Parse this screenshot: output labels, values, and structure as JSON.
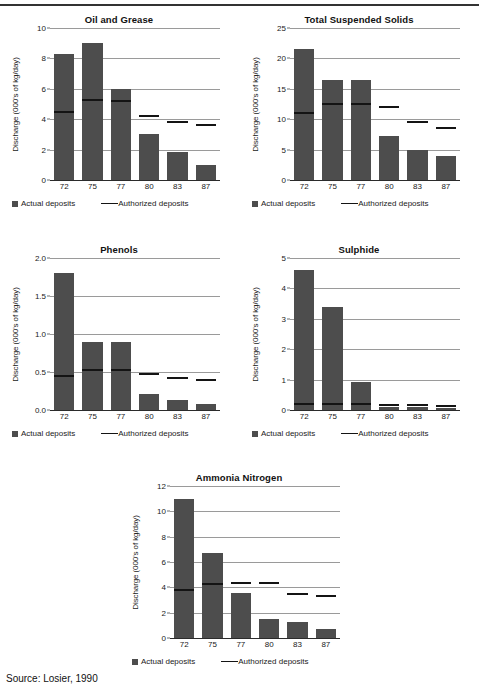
{
  "figure": {
    "source_note": "Source: Losier, 1990",
    "legend": {
      "actual_label": "Actual deposits",
      "authorized_label": "Authorized deposits"
    },
    "axis_label_y": "Discharge (000's of kg/day)",
    "bar_color": "#4d4d4d",
    "line_color": "#141414",
    "gridline_color": "#9a9a9a"
  },
  "chart_data": [
    {
      "type": "bar",
      "title": "Oil and Grease",
      "xlabel": "",
      "ylabel": "Discharge (000's of kg/day)",
      "categories": [
        "72",
        "75",
        "77",
        "80",
        "83",
        "87"
      ],
      "yticks": [
        "0",
        "2",
        "4",
        "6",
        "8",
        "10"
      ],
      "ytick_values": [
        0,
        2,
        4,
        6,
        8,
        10
      ],
      "ylim": [
        0,
        10
      ],
      "grid": true,
      "legend_position": "below",
      "series": [
        {
          "name": "Actual deposits",
          "type": "bar",
          "values": [
            8.3,
            9.0,
            6.0,
            3.0,
            1.85,
            1.0
          ]
        },
        {
          "name": "Authorized deposits",
          "type": "marker-line",
          "values": [
            4.5,
            5.25,
            5.2,
            4.2,
            3.8,
            3.6
          ]
        }
      ]
    },
    {
      "type": "bar",
      "title": "Total Suspended Solids",
      "xlabel": "",
      "ylabel": "Discharge (000's of kg/day)",
      "categories": [
        "72",
        "75",
        "77",
        "80",
        "83",
        "87"
      ],
      "yticks": [
        "0",
        "5",
        "10",
        "15",
        "20",
        "25"
      ],
      "ytick_values": [
        0,
        5,
        10,
        15,
        20,
        25
      ],
      "ylim": [
        0,
        25
      ],
      "grid": true,
      "legend_position": "below",
      "series": [
        {
          "name": "Actual deposits",
          "type": "bar",
          "values": [
            21.5,
            16.5,
            16.5,
            7.3,
            5.0,
            4.0
          ]
        },
        {
          "name": "Authorized deposits",
          "type": "marker-line",
          "values": [
            11.0,
            12.5,
            12.5,
            12.0,
            9.5,
            8.5
          ]
        }
      ]
    },
    {
      "type": "bar",
      "title": "Phenols",
      "xlabel": "",
      "ylabel": "Discharge (000's of kg/day)",
      "categories": [
        "72",
        "75",
        "77",
        "80",
        "83",
        "87"
      ],
      "yticks": [
        "0.0",
        "0.5",
        "1.0",
        "1.5",
        "2.0"
      ],
      "ytick_values": [
        0,
        0.5,
        1.0,
        1.5,
        2.0
      ],
      "ylim": [
        0,
        2.0
      ],
      "grid": true,
      "legend_position": "below",
      "series": [
        {
          "name": "Actual deposits",
          "type": "bar",
          "values": [
            1.8,
            0.9,
            0.9,
            0.21,
            0.13,
            0.08
          ]
        },
        {
          "name": "Authorized deposits",
          "type": "marker-line",
          "values": [
            0.45,
            0.53,
            0.53,
            0.48,
            0.42,
            0.39
          ]
        }
      ]
    },
    {
      "type": "bar",
      "title": "Sulphide",
      "xlabel": "",
      "ylabel": "Discharge (000's of kg/day)",
      "categories": [
        "72",
        "75",
        "77",
        "80",
        "83",
        "87"
      ],
      "yticks": [
        "0",
        "1",
        "2",
        "3",
        "4",
        "5"
      ],
      "ytick_values": [
        0,
        1,
        2,
        3,
        4,
        5
      ],
      "ylim": [
        0,
        5
      ],
      "grid": true,
      "legend_position": "below",
      "series": [
        {
          "name": "Actual deposits",
          "type": "bar",
          "values": [
            4.6,
            3.4,
            0.92,
            0.1,
            0.1,
            0.05
          ]
        },
        {
          "name": "Authorized deposits",
          "type": "marker-line",
          "values": [
            0.2,
            0.2,
            0.2,
            0.15,
            0.15,
            0.12
          ]
        }
      ]
    },
    {
      "type": "bar",
      "title": "Ammonia Nitrogen",
      "xlabel": "",
      "ylabel": "Discharge (000's of kg/day)",
      "categories": [
        "72",
        "75",
        "77",
        "80",
        "83",
        "87"
      ],
      "yticks": [
        "0",
        "2",
        "4",
        "6",
        "8",
        "10",
        "12"
      ],
      "ytick_values": [
        0,
        2,
        4,
        6,
        8,
        10,
        12
      ],
      "ylim": [
        0,
        12
      ],
      "grid": true,
      "legend_position": "below",
      "series": [
        {
          "name": "Actual deposits",
          "type": "bar",
          "values": [
            11.0,
            6.75,
            3.55,
            1.5,
            1.3,
            0.75
          ]
        },
        {
          "name": "Authorized deposits",
          "type": "marker-line",
          "values": [
            3.8,
            4.3,
            4.35,
            4.35,
            3.5,
            3.3
          ]
        }
      ]
    }
  ]
}
